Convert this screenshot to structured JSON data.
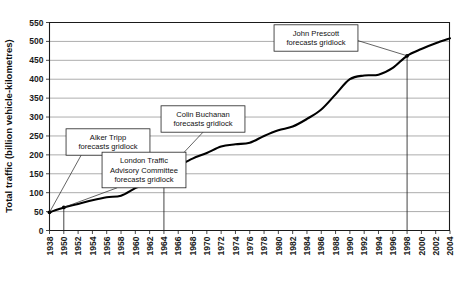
{
  "chart_data": {
    "type": "line",
    "title": "",
    "xlabel": "",
    "ylabel": "Total traffic (billion vehicle-kilometres)",
    "ylim": [
      0,
      550
    ],
    "ytick_step": 50,
    "yticks": [
      0,
      50,
      100,
      150,
      200,
      250,
      300,
      350,
      400,
      450,
      500,
      550
    ],
    "grid": true,
    "legend": "none",
    "xticks": [
      1938,
      1950,
      1952,
      1954,
      1956,
      1958,
      1960,
      1962,
      1964,
      1966,
      1968,
      1970,
      1972,
      1974,
      1976,
      1978,
      1980,
      1982,
      1984,
      1986,
      1988,
      1990,
      1992,
      1994,
      1996,
      1998,
      2000,
      2002,
      2004
    ],
    "series": [
      {
        "name": "Total traffic",
        "x": [
          1938,
          1950,
          1952,
          1954,
          1956,
          1958,
          1960,
          1962,
          1964,
          1966,
          1968,
          1970,
          1972,
          1974,
          1976,
          1978,
          1980,
          1982,
          1984,
          1986,
          1988,
          1990,
          1992,
          1994,
          1996,
          1998,
          2000,
          2002,
          2004
        ],
        "values": [
          48,
          61,
          70,
          80,
          88,
          92,
          112,
          130,
          150,
          170,
          190,
          205,
          222,
          228,
          232,
          250,
          265,
          275,
          295,
          320,
          360,
          400,
          410,
          412,
          430,
          462,
          480,
          495,
          508
        ]
      }
    ],
    "annotations": [
      {
        "id": "alker-tripp",
        "label_lines": [
          "Alker Tripp",
          "forecasts gridlock"
        ],
        "target_year": 1938,
        "target_value": 48
      },
      {
        "id": "london-traffic-advisory-committee",
        "label_lines": [
          "London Traffic",
          "Advisory Committee",
          "forecasts gridlock"
        ],
        "target_year": 1950,
        "target_value": 61
      },
      {
        "id": "colin-buchanan",
        "label_lines": [
          "Colin Buchanan",
          "forecasts gridlock"
        ],
        "target_year": 1964,
        "target_value": 150
      },
      {
        "id": "john-prescott",
        "label_lines": [
          "John Prescott",
          "forecasts gridlock"
        ],
        "target_year": 1998,
        "target_value": 462
      }
    ]
  }
}
